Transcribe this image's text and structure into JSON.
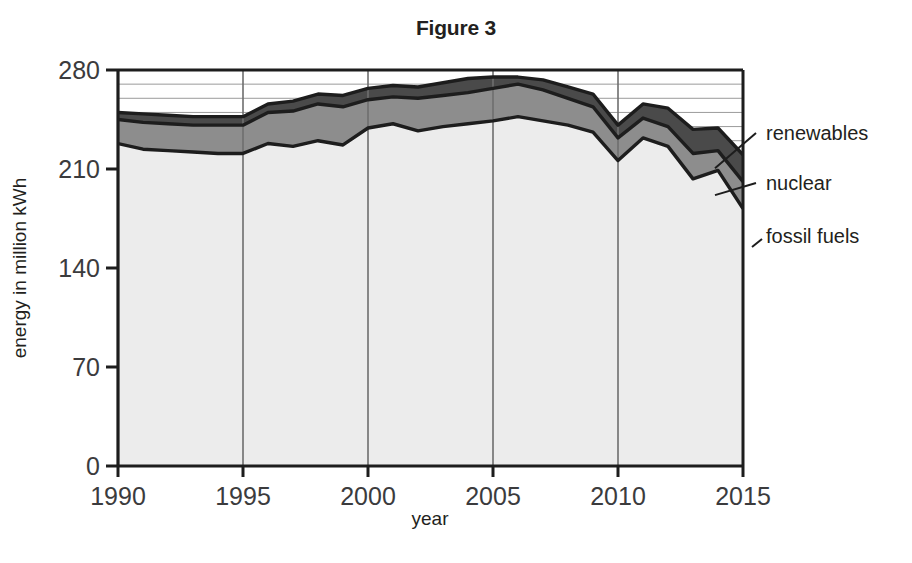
{
  "figure": {
    "title": "Figure 3",
    "top_cut_text": ""
  },
  "chart_data": {
    "type": "area",
    "stacked": true,
    "title": "Figure 3",
    "xlabel": "year",
    "ylabel": "energy in million kWh",
    "xlim": [
      1990,
      2015
    ],
    "ylim": [
      0,
      280
    ],
    "xticks": [
      1990,
      1995,
      2000,
      2005,
      2010,
      2015
    ],
    "yticks": [
      0,
      70,
      140,
      210,
      280
    ],
    "grid": "horizontal minor every 10 units, vertical at major xticks",
    "legend_position": "right-annotations with leader lines",
    "x": [
      1990,
      1991,
      1992,
      1993,
      1994,
      1995,
      1996,
      1997,
      1998,
      1999,
      2000,
      2001,
      2002,
      2003,
      2004,
      2005,
      2006,
      2007,
      2008,
      2009,
      2010,
      2011,
      2012,
      2013,
      2014,
      2015
    ],
    "series": [
      {
        "name": "fossil fuels",
        "color": "#ececec",
        "values": [
          228,
          224,
          223,
          222,
          221,
          221,
          228,
          226,
          230,
          227,
          239,
          242,
          237,
          240,
          242,
          244,
          247,
          244,
          241,
          236,
          216,
          232,
          226,
          203,
          209,
          182
        ]
      },
      {
        "name": "nuclear",
        "color": "#8d8d8d",
        "values": [
          17,
          19,
          19,
          19,
          20,
          20,
          22,
          25,
          26,
          27,
          20,
          19,
          23,
          22,
          22,
          23,
          23,
          22,
          19,
          18,
          16,
          14,
          14,
          18,
          14,
          19
        ]
      },
      {
        "name": "renewables",
        "color": "#4a4a4a",
        "values": [
          5,
          6,
          6,
          6,
          6,
          6,
          6,
          7,
          7,
          8,
          8,
          8,
          8,
          9,
          10,
          8,
          5,
          7,
          8,
          9,
          9,
          10,
          13,
          17,
          16,
          19
        ]
      }
    ],
    "totals": [
      250,
      249,
      248,
      247,
      247,
      247,
      256,
      258,
      263,
      262,
      267,
      269,
      268,
      271,
      274,
      275,
      275,
      273,
      268,
      263,
      241,
      256,
      253,
      238,
      239,
      220
    ],
    "annotations": [
      {
        "label": "renewables",
        "band": "renewables"
      },
      {
        "label": "nuclear",
        "band": "nuclear"
      },
      {
        "label": "fossil fuels",
        "band": "fossil fuels"
      }
    ]
  }
}
